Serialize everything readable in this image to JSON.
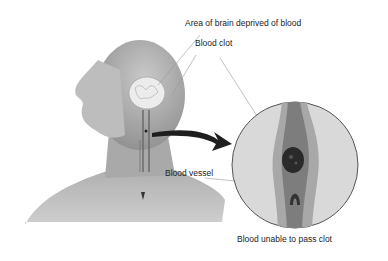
{
  "labels": {
    "brain_area": "Area of brain deprived of blood",
    "clot": "Blood clot",
    "vessel": "Blood vessel",
    "blocked": "Blood unable to pass clot"
  },
  "colors": {
    "skin": "#b8b8b8",
    "skin_dark": "#8a8a8a",
    "brain": "#e8e8e8",
    "inset_bg": "#d8d8d8",
    "vessel_wall": "#a5a5a5",
    "vessel_lumen": "#7a7a7a",
    "clot": "#2a2a2a",
    "arrow": "#1a1a1a"
  }
}
